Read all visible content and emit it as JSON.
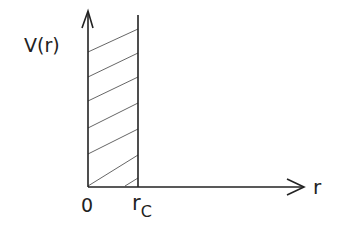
{
  "diagram": {
    "y_axis_label": "V(r)",
    "x_axis_label": "r",
    "origin_label": "0",
    "cutoff_label_main": "r",
    "cutoff_label_sub": "C",
    "region": "hatched area between r = 0 and r = r_C (infinite potential wall)",
    "colors": {
      "line": "#222222",
      "hatch": "#555555",
      "background": "#ffffff"
    }
  }
}
